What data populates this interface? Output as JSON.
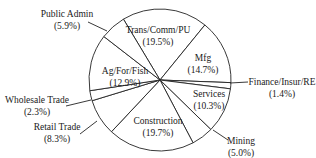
{
  "chart_data": {
    "type": "pie",
    "title": "",
    "start_angle_deg": -31,
    "direction": "clockwise",
    "slices": [
      {
        "label": "Trans/Comm/PU",
        "pct_label": "(19.5%)",
        "value": 19.5
      },
      {
        "label": "Mfg",
        "pct_label": "(14.7%)",
        "value": 14.7
      },
      {
        "label": "Finance/Insur/RE",
        "pct_label": "(1.4%)",
        "value": 1.4
      },
      {
        "label": "Services",
        "pct_label": "(10.3%)",
        "value": 10.3
      },
      {
        "label": "Mining",
        "pct_label": "(5.0%)",
        "value": 5.0
      },
      {
        "label": "Construction",
        "pct_label": "(19.7%)",
        "value": 19.7
      },
      {
        "label": "Retail Trade",
        "pct_label": "(8.3%)",
        "value": 8.3
      },
      {
        "label": "Wholesale Trade",
        "pct_label": "(2.3%)",
        "value": 2.3
      },
      {
        "label": "Ag/For/Fish",
        "pct_label": "(12.9%)",
        "value": 12.9
      },
      {
        "label": "Public Admin",
        "pct_label": "(5.9%)",
        "value": 5.9
      }
    ],
    "colors": {
      "fill": "#ffffff",
      "stroke": "#222222",
      "text": "#1a1a1a"
    }
  },
  "labels": {
    "public_admin": {
      "name": "Public Admin",
      "pct": "(5.9%)"
    },
    "trans": {
      "name": "Trans/Comm/PU",
      "pct": "(19.5%)"
    },
    "mfg": {
      "name": "Mfg",
      "pct": "(14.7%)"
    },
    "finance": {
      "name": "Finance/Insur/RE",
      "pct": "(1.4%)"
    },
    "ag": {
      "name": "Ag/For/Fish",
      "pct": "(12.9%)"
    },
    "services": {
      "name": "Services",
      "pct": "(10.3%)"
    },
    "wholesale": {
      "name": "Wholesale Trade",
      "pct": "(2.3%)"
    },
    "retail": {
      "name": "Retail Trade",
      "pct": "(8.3%)"
    },
    "construction": {
      "name": "Construction",
      "pct": "(19.7%)"
    },
    "mining": {
      "name": "Mining",
      "pct": "(5.0%)"
    }
  }
}
